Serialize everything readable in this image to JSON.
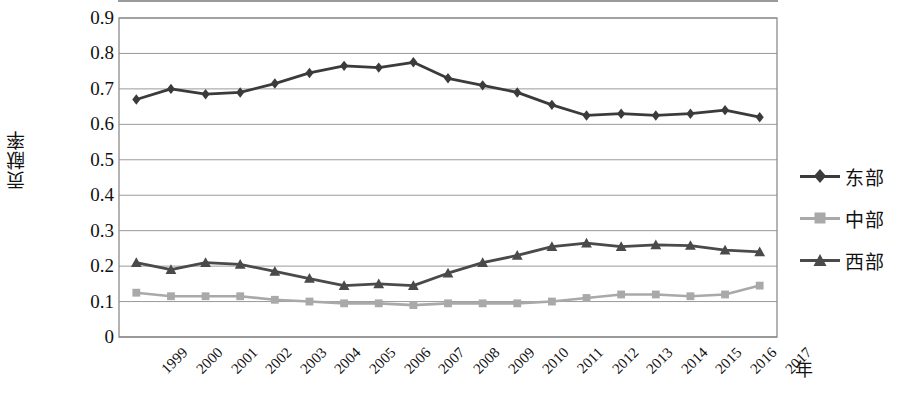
{
  "chart_data": {
    "type": "line",
    "title": "",
    "xlabel": "年",
    "ylabel": "贡献率",
    "ylim": [
      0,
      0.9
    ],
    "ystep": 0.1,
    "grid": true,
    "legend_position": "right",
    "categories": [
      "1999",
      "2000",
      "2001",
      "2002",
      "2003",
      "2004",
      "2005",
      "2006",
      "2007",
      "2008",
      "2009",
      "2010",
      "2011",
      "2012",
      "2013",
      "2014",
      "2015",
      "2016",
      "2017"
    ],
    "yticks": [
      "0.9",
      "0.8",
      "0.7",
      "0.6",
      "0.5",
      "0.4",
      "0.3",
      "0.2",
      "0.1",
      "0"
    ],
    "series": [
      {
        "name": "东部",
        "marker": "diamond",
        "color": "#3b3b3b",
        "values": [
          0.67,
          0.7,
          0.685,
          0.69,
          0.715,
          0.745,
          0.765,
          0.76,
          0.775,
          0.73,
          0.71,
          0.69,
          0.655,
          0.625,
          0.63,
          0.625,
          0.63,
          0.64,
          0.62
        ]
      },
      {
        "name": "中部",
        "marker": "square",
        "color": "#a9a9a9",
        "values": [
          0.125,
          0.115,
          0.115,
          0.115,
          0.105,
          0.1,
          0.095,
          0.095,
          0.09,
          0.095,
          0.095,
          0.095,
          0.1,
          0.11,
          0.12,
          0.12,
          0.115,
          0.12,
          0.145
        ]
      },
      {
        "name": "西部",
        "marker": "triangle",
        "color": "#4a4a4a",
        "values": [
          0.21,
          0.19,
          0.21,
          0.205,
          0.185,
          0.165,
          0.145,
          0.15,
          0.145,
          0.18,
          0.21,
          0.23,
          0.255,
          0.265,
          0.255,
          0.26,
          0.258,
          0.245,
          0.24
        ]
      }
    ]
  },
  "legend": {
    "items": [
      {
        "label": "东部"
      },
      {
        "label": "中部"
      },
      {
        "label": "西部"
      }
    ]
  },
  "axes": {
    "y_title": "贡献率",
    "x_title": "年"
  },
  "colors": {
    "east": "#3b3b3b",
    "central": "#a9a9a9",
    "west": "#4a4a4a",
    "grid": "#9a9a9a",
    "axis": "#8c8c8c",
    "text": "#111111"
  }
}
